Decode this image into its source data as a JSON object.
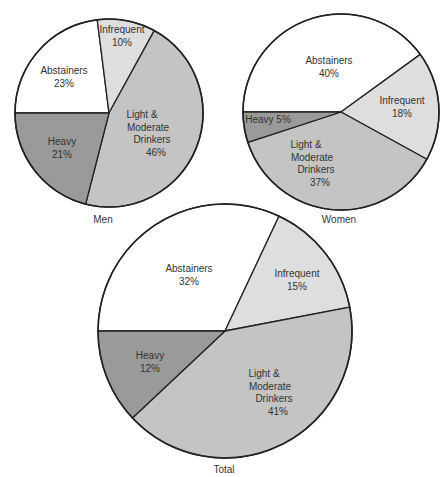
{
  "chart_data": [
    {
      "type": "pie",
      "title": "Men",
      "categories": [
        "Abstainers",
        "Infrequent",
        "Light & Moderate Drinkers",
        "Heavy"
      ],
      "values": [
        23,
        10,
        46,
        21
      ],
      "unit": "%",
      "start_angle": "9 o'clock, clockwise",
      "colors": [
        "#ffffff",
        "#dedede",
        "#c4c4c4",
        "#9a9a9a"
      ]
    },
    {
      "type": "pie",
      "title": "Women",
      "categories": [
        "Abstainers",
        "Infrequent",
        "Light & Moderate Drinkers",
        "Heavy"
      ],
      "values": [
        40,
        18,
        37,
        5
      ],
      "unit": "%",
      "start_angle": "9 o'clock, clockwise",
      "colors": [
        "#ffffff",
        "#dedede",
        "#c4c4c4",
        "#9a9a9a"
      ]
    },
    {
      "type": "pie",
      "title": "Total",
      "categories": [
        "Abstainers",
        "Infrequent",
        "Light & Moderate Drinkers",
        "Heavy"
      ],
      "values": [
        32,
        15,
        41,
        12
      ],
      "unit": "%",
      "start_angle": "9 o'clock, clockwise",
      "colors": [
        "#ffffff",
        "#dedede",
        "#c4c4c4",
        "#9a9a9a"
      ]
    }
  ],
  "pies": [
    {
      "caption": "Men",
      "cx": 109,
      "cy": 113,
      "r": 94,
      "cap_x": 103,
      "cap_y": 223,
      "slices": [
        {
          "name": "Abstainers",
          "pct": 23,
          "color": "#ffffff",
          "label_lines": [
            "Abstainers",
            "23%"
          ],
          "lx": 64,
          "ly": 74
        },
        {
          "name": "Infrequent",
          "pct": 10,
          "color": "#dedede",
          "label_lines": [
            "Infrequent",
            "10%"
          ],
          "lx": 122,
          "ly": 33
        },
        {
          "name": "Light & Moderate Drinkers",
          "pct": 46,
          "color": "#c4c4c4",
          "label_lines": [
            "Light &",
            "Moderate",
            "Drinkers",
            "46%"
          ],
          "lx": 148,
          "ly": 118,
          "align": [
            "end",
            "end",
            "end",
            "end"
          ]
        },
        {
          "name": "Heavy",
          "pct": 21,
          "color": "#9a9a9a",
          "label_lines": [
            "Heavy",
            "21%"
          ],
          "lx": 62,
          "ly": 145
        }
      ]
    },
    {
      "caption": "Women",
      "cx": 341,
      "cy": 112,
      "r": 98,
      "cap_x": 339,
      "cap_y": 223,
      "slices": [
        {
          "name": "Abstainers",
          "pct": 40,
          "color": "#ffffff",
          "label_lines": [
            "Abstainers",
            "40%"
          ],
          "lx": 329,
          "ly": 64
        },
        {
          "name": "Infrequent",
          "pct": 18,
          "color": "#dedede",
          "label_lines": [
            "Infrequent",
            "18%"
          ],
          "lx": 402,
          "ly": 104
        },
        {
          "name": "Light & Moderate Drinkers",
          "pct": 37,
          "color": "#c4c4c4",
          "label_lines": [
            "Light &",
            "Moderate",
            "Drinkers",
            "37%"
          ],
          "lx": 312,
          "ly": 148
        },
        {
          "name": "Heavy",
          "pct": 5,
          "color": "#9a9a9a",
          "label_lines": [
            "Heavy   5%"
          ],
          "lx": 268,
          "ly": 123
        }
      ]
    },
    {
      "caption": "Total",
      "cx": 225,
      "cy": 331,
      "r": 127,
      "cap_x": 224,
      "cap_y": 473,
      "slices": [
        {
          "name": "Abstainers",
          "pct": 32,
          "color": "#ffffff",
          "label_lines": [
            "Abstainers",
            "32%"
          ],
          "lx": 189,
          "ly": 272
        },
        {
          "name": "Infrequent",
          "pct": 15,
          "color": "#dedede",
          "label_lines": [
            "Infrequent",
            "15%"
          ],
          "lx": 297,
          "ly": 277
        },
        {
          "name": "Light & Moderate Drinkers",
          "pct": 41,
          "color": "#c4c4c4",
          "label_lines": [
            "Light &",
            "Moderate",
            "Drinkers",
            "41%"
          ],
          "lx": 270,
          "ly": 377
        },
        {
          "name": "Heavy",
          "pct": 12,
          "color": "#9a9a9a",
          "label_lines": [
            "Heavy",
            "12%"
          ],
          "lx": 150,
          "ly": 359
        }
      ]
    }
  ]
}
